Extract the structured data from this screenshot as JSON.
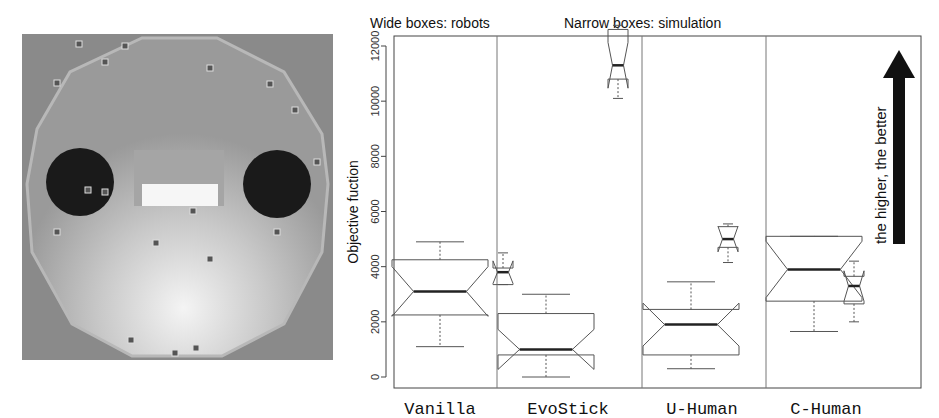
{
  "figure": {
    "left_panel": {
      "description": "Top-down photo of a dodecagonal robot arena with two black circles, a central white rectangle and several small robots"
    },
    "captions": {
      "wide": "Wide boxes: robots",
      "narrow": "Narrow boxes: simulation"
    },
    "arrow_note": "the higher, the better"
  },
  "chart_data": {
    "type": "box",
    "title": "",
    "xlabel": "",
    "ylabel": "Objective fuction",
    "ylim": [
      0,
      12800
    ],
    "yticks": [
      0,
      2000,
      4000,
      6000,
      8000,
      10000,
      12000
    ],
    "ytick_labels": [
      "0",
      "2000",
      "4000",
      "6000",
      "8000",
      "10000",
      "12000"
    ],
    "categories": [
      "Vanilla",
      "EvoStick",
      "U-Human",
      "C-Human"
    ],
    "notched": true,
    "grid": false,
    "legend": [
      "Wide boxes: robots",
      "Narrow boxes: simulation"
    ],
    "annotation": "the higher, the better",
    "series": [
      {
        "name": "robots",
        "box_width": "wide",
        "boxes": [
          {
            "category": "Vanilla",
            "whisker_low": 1100,
            "q1": 2250,
            "median": 3100,
            "q3": 4250,
            "whisker_high": 4900
          },
          {
            "category": "EvoStick",
            "whisker_low": 0,
            "q1": 800,
            "median": 1000,
            "q3": 2300,
            "whisker_high": 3000
          },
          {
            "category": "U-Human",
            "whisker_low": 300,
            "q1": 800,
            "median": 1900,
            "q3": 2450,
            "whisker_high": 3450
          },
          {
            "category": "C-Human",
            "whisker_low": 1650,
            "q1": 2750,
            "median": 3900,
            "q3": 5100,
            "whisker_high": 5100
          }
        ]
      },
      {
        "name": "simulation",
        "box_width": "narrow",
        "boxes": [
          {
            "category": "Vanilla",
            "whisker_low": 3350,
            "q1": 3350,
            "median": 3800,
            "q3": 3950,
            "whisker_high": 4500
          },
          {
            "category": "EvoStick",
            "whisker_low": 10100,
            "q1": 10800,
            "median": 11300,
            "q3": 12600,
            "whisker_high": 12750
          },
          {
            "category": "U-Human",
            "whisker_low": 4150,
            "q1": 4700,
            "median": 5000,
            "q3": 5450,
            "whisker_high": 5550
          },
          {
            "category": "C-Human",
            "whisker_low": 2000,
            "q1": 2650,
            "median": 3300,
            "q3": 3650,
            "whisker_high": 4200
          }
        ]
      }
    ]
  }
}
